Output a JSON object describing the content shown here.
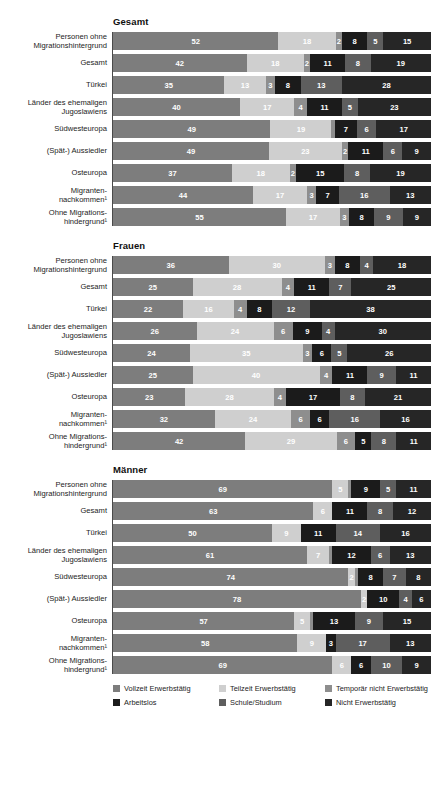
{
  "chart_data": {
    "type": "bar",
    "subtype": "stacked-horizontal-100",
    "title": "",
    "xlabel": "",
    "ylabel": "",
    "xlim": [
      0,
      100
    ],
    "grid": false,
    "legend_position": "bottom",
    "legend": [
      "Vollzeit Erwerbstätig",
      "Teilzeit Erwerbstätig",
      "Temporär nicht Erwerbstätig",
      "Arbeitslos",
      "Schule/Studium",
      "Nicht Erwerbstätig"
    ],
    "colors": [
      "#7d7d7d",
      "#cfcfcf",
      "#8e8e8e",
      "#1b1b1b",
      "#5e5e5e",
      "#262626"
    ],
    "categories": [
      "Personen ohne\nMigrationshintergrund",
      "Gesamt",
      "Türkei",
      "Länder des ehemaligen\nJugoslawiens",
      "Südwesteuropa",
      "(Spät-) Aussiedler",
      "Osteuropa",
      "Migranten-\nnachkommen¹",
      "Ohne Migrations-\nhindergrund¹"
    ],
    "panels": [
      {
        "title": "Gesamt",
        "rows": [
          {
            "label": "Personen ohne\nMigrationshintergrund",
            "values": [
              52,
              18,
              2,
              8,
              5,
              15
            ]
          },
          {
            "label": "Gesamt",
            "values": [
              42,
              18,
              2,
              11,
              8,
              19
            ]
          },
          {
            "label": "Türkei",
            "values": [
              35,
              13,
              3,
              8,
              13,
              28
            ]
          },
          {
            "label": "Länder des ehemaligen\nJugoslawiens",
            "values": [
              40,
              17,
              4,
              11,
              5,
              23
            ]
          },
          {
            "label": "Südwesteuropa",
            "values": [
              49,
              19,
              1,
              7,
              6,
              17
            ]
          },
          {
            "label": "(Spät-) Aussiedler",
            "values": [
              49,
              23,
              2,
              11,
              6,
              9
            ]
          },
          {
            "label": "Osteuropa",
            "values": [
              37,
              18,
              2,
              15,
              8,
              19
            ]
          },
          {
            "label": "Migranten-\nnachkommen¹",
            "values": [
              44,
              17,
              3,
              7,
              16,
              13
            ]
          },
          {
            "label": "Ohne Migrations-\nhindergrund¹",
            "values": [
              55,
              17,
              3,
              8,
              9,
              9
            ]
          }
        ]
      },
      {
        "title": "Frauen",
        "rows": [
          {
            "label": "Personen ohne\nMigrationshintergrund",
            "values": [
              36,
              30,
              3,
              8,
              4,
              18
            ]
          },
          {
            "label": "Gesamt",
            "values": [
              25,
              28,
              4,
              11,
              7,
              25
            ]
          },
          {
            "label": "Türkei",
            "values": [
              22,
              16,
              4,
              8,
              12,
              38
            ]
          },
          {
            "label": "Länder des ehemaligen\nJugoslawiens",
            "values": [
              26,
              24,
              6,
              9,
              4,
              30
            ]
          },
          {
            "label": "Südwesteuropa",
            "values": [
              24,
              35,
              3,
              6,
              5,
              26
            ]
          },
          {
            "label": "(Spät-) Aussiedler",
            "values": [
              25,
              40,
              4,
              11,
              9,
              11
            ]
          },
          {
            "label": "Osteuropa",
            "values": [
              23,
              28,
              4,
              17,
              8,
              21
            ]
          },
          {
            "label": "Migranten-\nnachkommen¹",
            "values": [
              32,
              24,
              6,
              6,
              16,
              16
            ]
          },
          {
            "label": "Ohne Migrations-\nhindergrund¹",
            "values": [
              42,
              29,
              6,
              5,
              8,
              11
            ]
          }
        ]
      },
      {
        "title": "Männer",
        "rows": [
          {
            "label": "Personen ohne\nMigrationshintergrund",
            "values": [
              69,
              5,
              1,
              9,
              5,
              11
            ]
          },
          {
            "label": "Gesamt",
            "values": [
              63,
              6,
              0,
              11,
              8,
              12
            ]
          },
          {
            "label": "Türkei",
            "values": [
              50,
              9,
              0,
              11,
              14,
              16
            ]
          },
          {
            "label": "Länder des ehemaligen\nJugoslawiens",
            "values": [
              61,
              7,
              1,
              12,
              6,
              13
            ]
          },
          {
            "label": "Südwesteuropa",
            "values": [
              74,
              2,
              1,
              8,
              7,
              8
            ]
          },
          {
            "label": "(Spät-) Aussiedler",
            "values": [
              78,
              2,
              0,
              10,
              4,
              6
            ]
          },
          {
            "label": "Osteuropa",
            "values": [
              57,
              5,
              1,
              13,
              9,
              15
            ]
          },
          {
            "label": "Migranten-\nnachkommen¹",
            "values": [
              58,
              9,
              0,
              3,
              17,
              13
            ]
          },
          {
            "label": "Ohne Migrations-\nhindergrund¹",
            "values": [
              69,
              6,
              0,
              6,
              10,
              9
            ]
          }
        ]
      }
    ]
  }
}
